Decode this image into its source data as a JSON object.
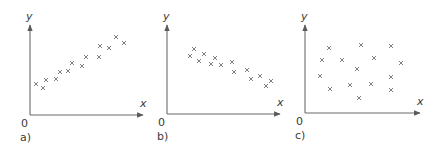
{
  "panels": [
    {
      "label": "a)",
      "origin_label": "0",
      "x_axis_label": "x",
      "y_axis_label": "y",
      "correlation": "positive",
      "axis": {
        "ox": 30,
        "oy": 115,
        "x_end": 143,
        "y_top": 25
      },
      "points": [
        [
          36,
          84
        ],
        [
          43,
          88
        ],
        [
          46,
          80
        ],
        [
          56,
          79
        ],
        [
          60,
          72
        ],
        [
          68,
          71
        ],
        [
          72,
          63
        ],
        [
          82,
          66
        ],
        [
          86,
          57
        ],
        [
          99,
          57
        ],
        [
          100,
          46
        ],
        [
          109,
          48
        ],
        [
          116,
          37
        ],
        [
          124,
          43
        ]
      ]
    },
    {
      "label": "b)",
      "origin_label": "0",
      "x_axis_label": "x",
      "y_axis_label": "y",
      "correlation": "negative",
      "axis": {
        "ox": 167,
        "oy": 114,
        "x_end": 280,
        "y_top": 25
      },
      "points": [
        [
          190,
          56
        ],
        [
          194,
          49
        ],
        [
          199,
          61
        ],
        [
          204,
          54
        ],
        [
          211,
          64
        ],
        [
          215,
          58
        ],
        [
          221,
          65
        ],
        [
          232,
          62
        ],
        [
          234,
          72
        ],
        [
          247,
          70
        ],
        [
          251,
          79
        ],
        [
          260,
          76
        ],
        [
          271,
          81
        ],
        [
          266,
          86
        ]
      ]
    },
    {
      "label": "c)",
      "origin_label": "0",
      "x_axis_label": "x",
      "y_axis_label": "y",
      "correlation": "none",
      "axis": {
        "ox": 305,
        "oy": 113,
        "x_end": 420,
        "y_top": 25
      },
      "points": [
        [
          329,
          48
        ],
        [
          361,
          45
        ],
        [
          391,
          46
        ],
        [
          322,
          60
        ],
        [
          342,
          60
        ],
        [
          374,
          58
        ],
        [
          401,
          63
        ],
        [
          357,
          69
        ],
        [
          320,
          76
        ],
        [
          391,
          77
        ],
        [
          330,
          89
        ],
        [
          350,
          85
        ],
        [
          371,
          84
        ],
        [
          391,
          90
        ],
        [
          359,
          98
        ]
      ]
    }
  ],
  "chart_data": [
    {
      "type": "scatter",
      "title": "a)",
      "xlabel": "x",
      "ylabel": "y",
      "correlation": "positive",
      "x": [
        1,
        2,
        3,
        4,
        5,
        6,
        7,
        8,
        9,
        10,
        11,
        12,
        13,
        14
      ],
      "y": [
        3.1,
        2.6,
        3.5,
        3.6,
        4.3,
        4.4,
        5.2,
        4.9,
        5.8,
        5.8,
        6.9,
        6.7,
        7.7,
        7.2
      ]
    },
    {
      "type": "scatter",
      "title": "b)",
      "xlabel": "x",
      "ylabel": "y",
      "correlation": "negative",
      "x": [
        1,
        2,
        3,
        4,
        5,
        6,
        7,
        8,
        9,
        10,
        11,
        12,
        13,
        14
      ],
      "y": [
        5.9,
        6.6,
        5.4,
        6.1,
        5.1,
        5.7,
        5.0,
        5.3,
        4.3,
        4.5,
        3.6,
        3.9,
        3.4,
        2.9
      ]
    },
    {
      "type": "scatter",
      "title": "c)",
      "xlabel": "x",
      "ylabel": "y",
      "correlation": "none",
      "x": [
        2.4,
        5.6,
        8.6,
        1.7,
        3.7,
        6.9,
        9.6,
        5.2,
        1.5,
        8.6,
        2.5,
        4.5,
        6.6,
        8.6,
        5.4
      ],
      "y": [
        6.5,
        6.8,
        6.7,
        5.3,
        5.3,
        5.5,
        5.0,
        4.4,
        3.7,
        3.6,
        2.4,
        2.8,
        2.9,
        2.3,
        1.5
      ]
    }
  ]
}
